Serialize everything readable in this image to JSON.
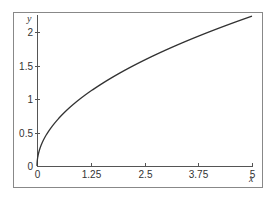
{
  "chart_data": {
    "type": "line",
    "title": "",
    "xlabel": "x",
    "ylabel": "y",
    "xlim": [
      0,
      5
    ],
    "ylim": [
      0,
      2.236
    ],
    "grid": false,
    "x_ticks": [
      0,
      1.25,
      2.5,
      3.75,
      5
    ],
    "x_tick_labels": [
      "0",
      "1.25",
      "2.5",
      "3.75",
      "5"
    ],
    "y_ticks": [
      0,
      0.5,
      1,
      1.5,
      2
    ],
    "y_tick_labels": [
      "0",
      "0.5",
      "1",
      "1.5",
      "2"
    ],
    "series": [
      {
        "name": "y = sqrt(x)",
        "function": "sqrt",
        "x": [
          0,
          0.05,
          0.1,
          0.25,
          0.5,
          0.75,
          1,
          1.25,
          1.5,
          2,
          2.5,
          3,
          3.5,
          3.75,
          4,
          4.5,
          5
        ],
        "values": [
          0,
          0.224,
          0.316,
          0.5,
          0.707,
          0.866,
          1,
          1.118,
          1.225,
          1.414,
          1.581,
          1.732,
          1.871,
          1.936,
          2,
          2.121,
          2.236
        ],
        "color": "#333333"
      }
    ]
  },
  "colors": {
    "frame": "#888888",
    "axis": "#555555",
    "curve": "#333333"
  }
}
